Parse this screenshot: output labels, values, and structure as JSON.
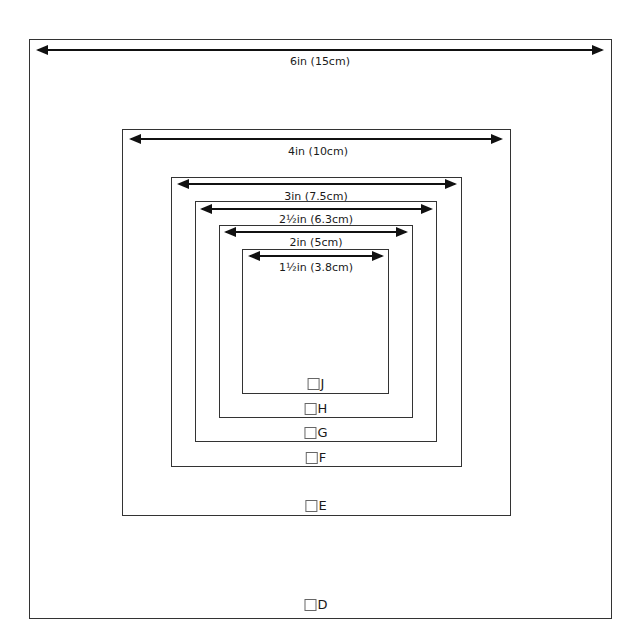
{
  "diagram": {
    "squares": [
      {
        "id": "D",
        "size_label": "6in (15cm)",
        "checkbox_label": "D",
        "checked": false
      },
      {
        "id": "E",
        "size_label": "4in (10cm)",
        "checkbox_label": "E",
        "checked": false
      },
      {
        "id": "F",
        "size_label": "3in (7.5cm)",
        "checkbox_label": "F",
        "checked": false
      },
      {
        "id": "G",
        "size_label": "2½in (6.3cm)",
        "checkbox_label": "G",
        "checked": false
      },
      {
        "id": "H",
        "size_label": "2in (5cm)",
        "checkbox_label": "H",
        "checked": false
      },
      {
        "id": "J",
        "size_label": "1½in (3.8cm)",
        "checkbox_label": "J",
        "checked": false
      }
    ],
    "colors": {
      "line": "#333333",
      "text": "#1a1a1a",
      "background": "#ffffff"
    }
  }
}
